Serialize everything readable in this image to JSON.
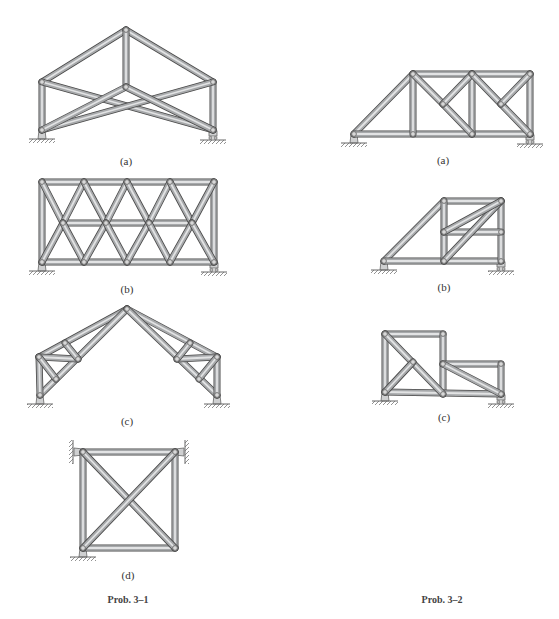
{
  "figure": {
    "member_color": "#a7a9ab",
    "member_highlight": "#e2e3e4",
    "member_outline": "#4a4a4a",
    "joint_color": "#6b6b6b",
    "ground_color": "#7d7d7d"
  },
  "problems": [
    {
      "id": "prob-3-1",
      "caption": "Prob. 3–1",
      "trusses": [
        {
          "label": "(a)",
          "nodes": [
            [
              126,
              30
            ],
            [
              42,
              82
            ],
            [
              213,
              82
            ],
            [
              126,
              87
            ],
            [
              42,
              130
            ],
            [
              213,
              130
            ]
          ],
          "members": [
            [
              0,
              1
            ],
            [
              0,
              2
            ],
            [
              0,
              3
            ],
            [
              1,
              4
            ],
            [
              2,
              5
            ],
            [
              1,
              5
            ],
            [
              2,
              4
            ],
            [
              3,
              4
            ],
            [
              3,
              5
            ]
          ],
          "supports": [
            {
              "type": "pin",
              "at": [
                42,
                130
              ]
            },
            {
              "type": "roller",
              "at": [
                213,
                130
              ]
            }
          ]
        },
        {
          "label": "(b)",
          "nodes": [
            [
              42,
              182
            ],
            [
              84,
              182
            ],
            [
              127,
              182
            ],
            [
              170,
              182
            ],
            [
              214,
              182
            ],
            [
              63,
              223
            ],
            [
              106,
              223
            ],
            [
              149,
              223
            ],
            [
              192,
              223
            ],
            [
              42,
              262
            ],
            [
              84,
              262
            ],
            [
              127,
              262
            ],
            [
              170,
              262
            ],
            [
              214,
              262
            ]
          ],
          "members": [
            [
              0,
              4
            ],
            [
              9,
              13
            ],
            [
              5,
              8
            ],
            [
              0,
              9
            ],
            [
              4,
              13
            ],
            [
              0,
              5
            ],
            [
              5,
              1
            ],
            [
              1,
              6
            ],
            [
              6,
              2
            ],
            [
              2,
              7
            ],
            [
              7,
              3
            ],
            [
              3,
              8
            ],
            [
              8,
              4
            ],
            [
              9,
              5
            ],
            [
              5,
              10
            ],
            [
              10,
              6
            ],
            [
              6,
              11
            ],
            [
              11,
              7
            ],
            [
              7,
              12
            ],
            [
              12,
              8
            ],
            [
              8,
              13
            ]
          ],
          "supports": [
            {
              "type": "pin",
              "at": [
                42,
                262
              ]
            },
            {
              "type": "roller",
              "at": [
                214,
                262
              ]
            }
          ]
        },
        {
          "label": "(c)",
          "nodes": [
            [
              127,
              309
            ],
            [
              39,
              357
            ],
            [
              40,
              395
            ],
            [
              65,
              343
            ],
            [
              78,
              359
            ],
            [
              56,
              379
            ],
            [
              217,
              357
            ],
            [
              217,
              395
            ],
            [
              190,
              343
            ],
            [
              177,
              359
            ],
            [
              199,
              379
            ]
          ],
          "members": [
            [
              0,
              1
            ],
            [
              0,
              2
            ],
            [
              1,
              2
            ],
            [
              1,
              4
            ],
            [
              3,
              4
            ],
            [
              1,
              5
            ],
            [
              0,
              6
            ],
            [
              0,
              7
            ],
            [
              6,
              7
            ],
            [
              6,
              9
            ],
            [
              8,
              9
            ],
            [
              6,
              10
            ]
          ],
          "supports": [
            {
              "type": "pin",
              "at": [
                40,
                395
              ]
            },
            {
              "type": "pin",
              "at": [
                217,
                395
              ]
            }
          ]
        },
        {
          "label": "(d)",
          "nodes": [
            [
              83,
              452
            ],
            [
              175,
              452
            ],
            [
              83,
              548
            ],
            [
              175,
              548
            ]
          ],
          "members": [
            [
              0,
              1
            ],
            [
              2,
              3
            ],
            [
              0,
              2
            ],
            [
              1,
              3
            ],
            [
              0,
              3
            ],
            [
              1,
              2
            ]
          ],
          "supports": [
            {
              "type": "wall-left",
              "at": [
                83,
                452
              ]
            },
            {
              "type": "wall-right",
              "at": [
                175,
                452
              ]
            },
            {
              "type": "pin",
              "at": [
                83,
                548
              ]
            }
          ]
        }
      ]
    },
    {
      "id": "prob-3-2",
      "caption": "Prob. 3–2",
      "trusses": [
        {
          "label": "(a)",
          "nodes": [
            [
              354,
              134
            ],
            [
              413,
              74
            ],
            [
              472,
              74
            ],
            [
              530,
              74
            ],
            [
              413,
              134
            ],
            [
              472,
              134
            ],
            [
              530,
              134
            ],
            [
              443,
              104
            ],
            [
              501,
              104
            ]
          ],
          "members": [
            [
              0,
              1
            ],
            [
              1,
              3
            ],
            [
              0,
              6
            ],
            [
              1,
              4
            ],
            [
              2,
              5
            ],
            [
              3,
              6
            ],
            [
              1,
              7
            ],
            [
              7,
              5
            ],
            [
              7,
              2
            ],
            [
              2,
              8
            ],
            [
              8,
              6
            ],
            [
              8,
              3
            ]
          ],
          "supports": [
            {
              "type": "pin",
              "at": [
                354,
                134
              ]
            },
            {
              "type": "roller",
              "at": [
                530,
                134
              ]
            }
          ]
        },
        {
          "label": "(b)",
          "nodes": [
            [
              384,
              261
            ],
            [
              444,
              201
            ],
            [
              501,
              201
            ],
            [
              444,
              232
            ],
            [
              501,
              232
            ],
            [
              444,
              261
            ],
            [
              501,
              261
            ]
          ],
          "members": [
            [
              0,
              1
            ],
            [
              1,
              2
            ],
            [
              0,
              6
            ],
            [
              1,
              5
            ],
            [
              2,
              6
            ],
            [
              3,
              4
            ],
            [
              5,
              2
            ],
            [
              3,
              2
            ]
          ],
          "supports": [
            {
              "type": "pin",
              "at": [
                384,
                261
              ]
            },
            {
              "type": "roller",
              "at": [
                501,
                261
              ]
            }
          ]
        },
        {
          "label": "(c)",
          "nodes": [
            [
              385,
              334
            ],
            [
              443,
              334
            ],
            [
              413,
              362
            ],
            [
              443,
              364
            ],
            [
              501,
              364
            ],
            [
              385,
              392
            ],
            [
              443,
              394
            ],
            [
              501,
              394
            ]
          ],
          "members": [
            [
              0,
              1
            ],
            [
              0,
              5
            ],
            [
              1,
              6
            ],
            [
              5,
              7
            ],
            [
              3,
              4
            ],
            [
              4,
              7
            ],
            [
              0,
              6
            ],
            [
              5,
              2
            ],
            [
              3,
              7
            ]
          ],
          "supports": [
            {
              "type": "pin",
              "at": [
                385,
                392
              ]
            },
            {
              "type": "roller",
              "at": [
                501,
                394
              ]
            }
          ]
        }
      ]
    }
  ],
  "labels": {
    "p1_a": "(a)",
    "p1_b": "(b)",
    "p1_c": "(c)",
    "p1_d": "(d)",
    "p2_a": "(a)",
    "p2_b": "(b)",
    "p2_c": "(c)",
    "caption_1": "Prob. 3–1",
    "caption_2": "Prob. 3–2"
  }
}
